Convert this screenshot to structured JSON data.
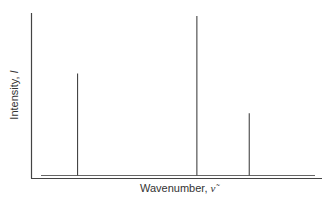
{
  "chart_data": {
    "type": "bar",
    "title": "",
    "xlabel": "Wavenumber, ν̃",
    "ylabel": "Intensity, I",
    "x": [
      0.16,
      0.57,
      0.75
    ],
    "values": [
      0.64,
      1.0,
      0.39
    ],
    "grid": false,
    "legend": null
  },
  "labels": {
    "y_axis_text": "Intensity, ",
    "y_axis_symbol": "I",
    "x_axis_text": "Wavenumber, ",
    "x_axis_symbol": "ν̃"
  }
}
